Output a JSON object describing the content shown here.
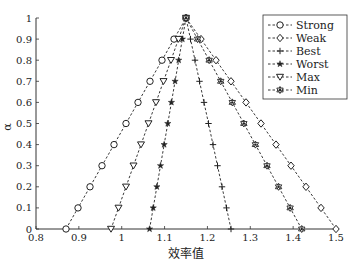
{
  "chart_data": {
    "type": "line",
    "title": "",
    "xlabel": "效率值",
    "ylabel": "α",
    "xlim": [
      0.8,
      1.5
    ],
    "ylim": [
      0,
      1
    ],
    "xticks": [
      0.8,
      0.9,
      1,
      1.1,
      1.2,
      1.3,
      1.4,
      1.5
    ],
    "xtick_labels": [
      "0.8",
      "0.9",
      "1",
      "1.1",
      "1.2",
      "1.3",
      "1.4",
      "1.5"
    ],
    "yticks": [
      0,
      0.1,
      0.2,
      0.3,
      0.4,
      0.5,
      0.6,
      0.7,
      0.8,
      0.9,
      1
    ],
    "ytick_labels": [
      "0",
      "0.1",
      "0.2",
      "0.3",
      "0.4",
      "0.5",
      "0.6",
      "0.7",
      "0.8",
      "0.9",
      "1"
    ],
    "grid": false,
    "legend_position": "upper right",
    "y": [
      0,
      0.1,
      0.2,
      0.3,
      0.4,
      0.5,
      0.6,
      0.7,
      0.8,
      0.9,
      1
    ],
    "series": [
      {
        "name": "Strong",
        "marker": "circle",
        "x": [
          0.87,
          0.898,
          0.926,
          0.954,
          0.982,
          1.01,
          1.038,
          1.066,
          1.094,
          1.122,
          1.15
        ]
      },
      {
        "name": "Weak",
        "marker": "diamond",
        "x": [
          1.5,
          1.465,
          1.43,
          1.395,
          1.36,
          1.325,
          1.29,
          1.255,
          1.22,
          1.185,
          1.15
        ]
      },
      {
        "name": "Best",
        "marker": "plus",
        "x": [
          1.255,
          1.2445,
          1.234,
          1.2235,
          1.213,
          1.2025,
          1.192,
          1.1815,
          1.171,
          1.1605,
          1.15
        ]
      },
      {
        "name": "Worst",
        "marker": "star",
        "x": [
          1.065,
          1.0735,
          1.082,
          1.0905,
          1.099,
          1.1075,
          1.116,
          1.1245,
          1.133,
          1.1415,
          1.15
        ]
      },
      {
        "name": "Max",
        "marker": "triangle-down",
        "x": [
          0.975,
          0.9925,
          1.01,
          1.0275,
          1.045,
          1.0625,
          1.08,
          1.0975,
          1.115,
          1.1325,
          1.15
        ]
      },
      {
        "name": "Min",
        "marker": "hexagram",
        "x": [
          1.42,
          1.393,
          1.366,
          1.339,
          1.312,
          1.285,
          1.258,
          1.231,
          1.204,
          1.177,
          1.15
        ]
      }
    ]
  },
  "legend": {
    "items": [
      {
        "label": "Strong",
        "marker": "circle"
      },
      {
        "label": "Weak",
        "marker": "diamond"
      },
      {
        "label": "Best",
        "marker": "plus"
      },
      {
        "label": "Worst",
        "marker": "star"
      },
      {
        "label": "Max",
        "marker": "triangle-down"
      },
      {
        "label": "Min",
        "marker": "hexagram"
      }
    ]
  },
  "colors": {
    "line": "#222222",
    "axis": "#333333",
    "background": "#ffffff"
  }
}
